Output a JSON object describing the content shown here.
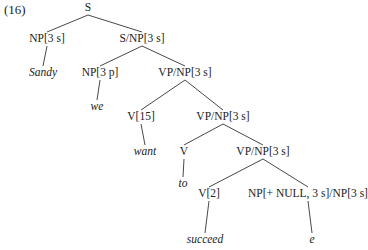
{
  "example_number": "(16)",
  "tree": {
    "nodes": [
      {
        "id": "n0",
        "label": "S",
        "x": 88,
        "y": 8,
        "leaf": false
      },
      {
        "id": "n1",
        "label": "NP[3 s]",
        "x": 47,
        "y": 39,
        "leaf": false
      },
      {
        "id": "n2",
        "label": "S/NP[3 s]",
        "x": 142,
        "y": 39,
        "leaf": false
      },
      {
        "id": "n3",
        "label": "Sandy",
        "x": 43,
        "y": 73,
        "leaf": true
      },
      {
        "id": "n4",
        "label": "NP[3 p]",
        "x": 100,
        "y": 73,
        "leaf": false
      },
      {
        "id": "n5",
        "label": "VP/NP[3 s]",
        "x": 185,
        "y": 73,
        "leaf": false
      },
      {
        "id": "n6",
        "label": "we",
        "x": 97,
        "y": 107,
        "leaf": true
      },
      {
        "id": "n7",
        "label": "V[15]",
        "x": 141,
        "y": 117,
        "leaf": false
      },
      {
        "id": "n8",
        "label": "VP/NP[3 s]",
        "x": 223,
        "y": 117,
        "leaf": false
      },
      {
        "id": "n9",
        "label": "want",
        "x": 145,
        "y": 152,
        "leaf": true
      },
      {
        "id": "n10",
        "label": "V",
        "x": 184,
        "y": 152,
        "leaf": false
      },
      {
        "id": "n11",
        "label": "VP/NP[3 s]",
        "x": 263,
        "y": 152,
        "leaf": false
      },
      {
        "id": "n12",
        "label": "to",
        "x": 183,
        "y": 184,
        "leaf": true
      },
      {
        "id": "n13",
        "label": "V[2]",
        "x": 209,
        "y": 194,
        "leaf": false
      },
      {
        "id": "n14",
        "label": "NP[+ NULL, 3 s]/NP[3 s]",
        "x": 308,
        "y": 194,
        "leaf": false
      },
      {
        "id": "n15",
        "label": "succeed",
        "x": 205,
        "y": 240,
        "leaf": true
      },
      {
        "id": "n16",
        "label": "e",
        "x": 312,
        "y": 240,
        "leaf": true
      }
    ],
    "edges": [
      [
        "n0",
        "n1"
      ],
      [
        "n0",
        "n2"
      ],
      [
        "n1",
        "n3"
      ],
      [
        "n2",
        "n4"
      ],
      [
        "n2",
        "n5"
      ],
      [
        "n4",
        "n6"
      ],
      [
        "n5",
        "n7"
      ],
      [
        "n5",
        "n8"
      ],
      [
        "n7",
        "n9"
      ],
      [
        "n8",
        "n10"
      ],
      [
        "n8",
        "n11"
      ],
      [
        "n10",
        "n12"
      ],
      [
        "n11",
        "n13"
      ],
      [
        "n11",
        "n14"
      ],
      [
        "n13",
        "n15"
      ],
      [
        "n14",
        "n16"
      ]
    ]
  }
}
